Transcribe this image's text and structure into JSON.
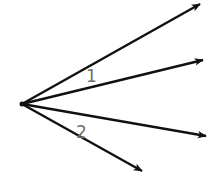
{
  "diagram": {
    "type": "rays-from-common-vertex",
    "vertex": {
      "x": 22,
      "y": 104
    },
    "ray_color": "#111111",
    "label_color": "#6f6f6f",
    "rays": [
      {
        "id": "ray-a",
        "end": {
          "x": 200,
          "y": 4
        }
      },
      {
        "id": "ray-b",
        "end": {
          "x": 203,
          "y": 60
        }
      },
      {
        "id": "ray-c",
        "end": {
          "x": 206,
          "y": 136
        }
      },
      {
        "id": "ray-d",
        "end": {
          "x": 142,
          "y": 171
        }
      }
    ],
    "angle_labels": [
      {
        "text": "1",
        "between": [
          "ray-a",
          "ray-b"
        ],
        "x": 86,
        "y": 82
      },
      {
        "text": "2",
        "between": [
          "ray-c",
          "ray-d"
        ],
        "x": 76,
        "y": 138
      }
    ]
  }
}
